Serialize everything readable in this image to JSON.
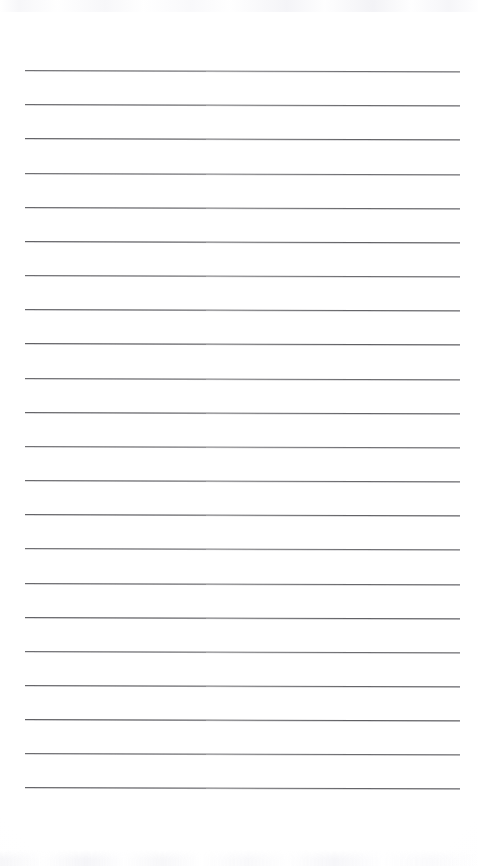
{
  "document": {
    "type": "scanned-lined-notebook-page",
    "title": "",
    "page_number": "",
    "written_text": "",
    "is_blank": "true"
  },
  "canvas": {
    "width": 478,
    "height": 866,
    "background_color": "#fefeff",
    "paper_tone": "#ffffff"
  },
  "ruling": {
    "line_count": 22,
    "line_color": "#5a5a5e",
    "line_thickness_px": 1,
    "first_line_y": 70,
    "line_spacing_px": 34.1,
    "left_margin_x": 25,
    "right_margin_x": 460,
    "line_length_px": 435,
    "skew_degrees": 0.16,
    "lines": [
      {
        "index": 1,
        "y": 70,
        "content": ""
      },
      {
        "index": 2,
        "y": 104,
        "content": ""
      },
      {
        "index": 3,
        "y": 138,
        "content": ""
      },
      {
        "index": 4,
        "y": 173,
        "content": ""
      },
      {
        "index": 5,
        "y": 207,
        "content": ""
      },
      {
        "index": 6,
        "y": 241,
        "content": ""
      },
      {
        "index": 7,
        "y": 275,
        "content": ""
      },
      {
        "index": 8,
        "y": 309,
        "content": ""
      },
      {
        "index": 9,
        "y": 343,
        "content": ""
      },
      {
        "index": 10,
        "y": 378,
        "content": ""
      },
      {
        "index": 11,
        "y": 412,
        "content": ""
      },
      {
        "index": 12,
        "y": 446,
        "content": ""
      },
      {
        "index": 13,
        "y": 480,
        "content": ""
      },
      {
        "index": 14,
        "y": 514,
        "content": ""
      },
      {
        "index": 15,
        "y": 548,
        "content": ""
      },
      {
        "index": 16,
        "y": 583,
        "content": ""
      },
      {
        "index": 17,
        "y": 617,
        "content": ""
      },
      {
        "index": 18,
        "y": 651,
        "content": ""
      },
      {
        "index": 19,
        "y": 685,
        "content": ""
      },
      {
        "index": 20,
        "y": 719,
        "content": ""
      },
      {
        "index": 21,
        "y": 753,
        "content": ""
      },
      {
        "index": 22,
        "y": 787,
        "content": ""
      }
    ]
  },
  "artifacts": {
    "top_bleedthrough": {
      "present": "true",
      "y": 0,
      "height": 12,
      "color": "#f3f3f6"
    },
    "bottom_bleedthrough": {
      "present": "true",
      "y": 850,
      "height": 16,
      "color": "#f3f3f6"
    }
  }
}
